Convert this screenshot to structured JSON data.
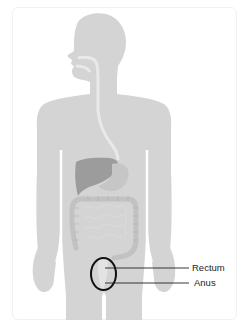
{
  "diagram": {
    "labels": [
      {
        "id": "rectum",
        "text": "Rectum"
      },
      {
        "id": "anus",
        "text": "Anus"
      }
    ],
    "highlight": {
      "shape": "ellipse",
      "target": "rectum-and-anus",
      "color": "#111111"
    },
    "colors": {
      "body": "#d4d4d4",
      "tract": "#e9e9e9",
      "liver": "#9c9c9c",
      "colon": "#c2c2c2",
      "leader_line": "#222222",
      "card_border": "#f1f1f1"
    }
  }
}
